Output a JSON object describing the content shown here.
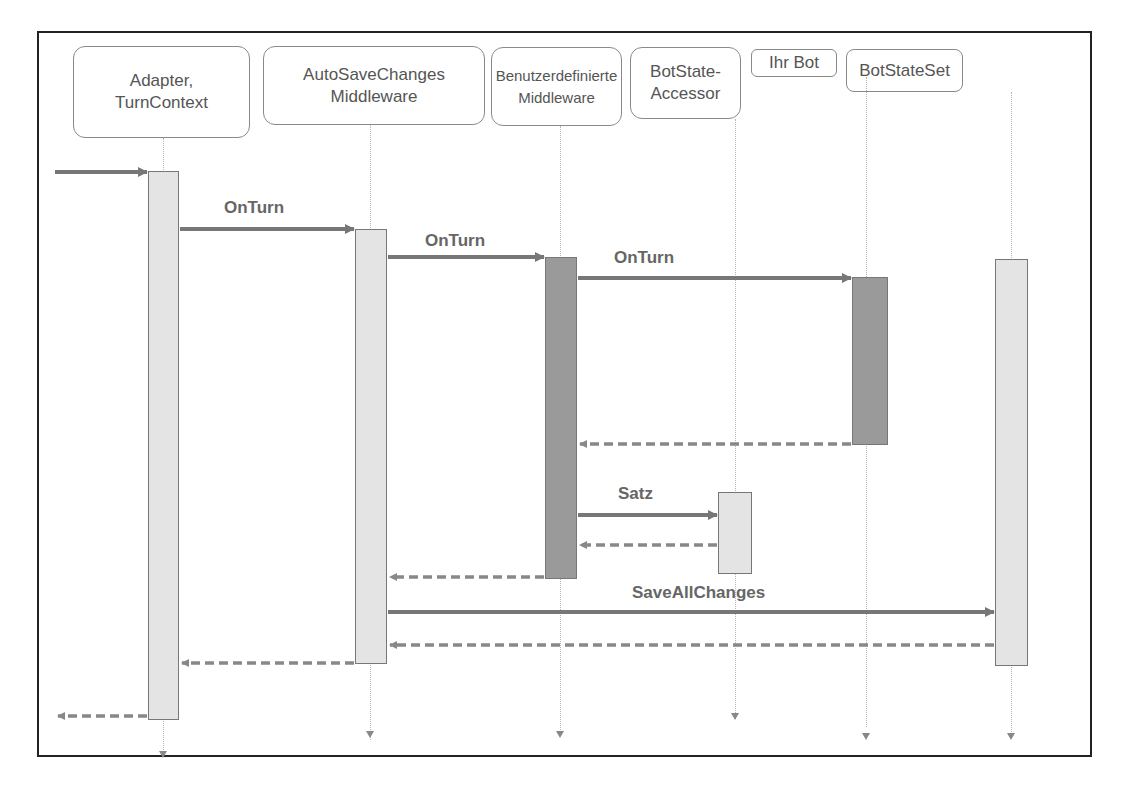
{
  "colors": {
    "frame": "#222222",
    "participant_border": "#8a8a8a",
    "text": "#555555",
    "arrow": "#777777",
    "activation_light": "#e4e4e4",
    "activation_dark": "#9a9a9a"
  },
  "participants": [
    {
      "id": "adapter",
      "label_line1": "Adapter,",
      "label_line2": "TurnContext"
    },
    {
      "id": "autosave",
      "label_line1": "AutoSaveChanges",
      "label_line2": "Middleware"
    },
    {
      "id": "custom",
      "label_line1": "Benutzerdefinierte",
      "label_line2": "Middleware"
    },
    {
      "id": "accessor",
      "label_line1": "BotState-",
      "label_line2": "Accessor"
    },
    {
      "id": "bot",
      "label_line1": "Ihr Bot",
      "label_line2": ""
    },
    {
      "id": "stateset",
      "label_line1": "BotStateSet",
      "label_line2": ""
    }
  ],
  "messages": [
    {
      "from": "external",
      "to": "adapter",
      "type": "call",
      "label": ""
    },
    {
      "from": "adapter",
      "to": "autosave",
      "type": "call",
      "label": "OnTurn"
    },
    {
      "from": "autosave",
      "to": "custom",
      "type": "call",
      "label": "OnTurn"
    },
    {
      "from": "custom",
      "to": "bot",
      "type": "call",
      "label": "OnTurn"
    },
    {
      "from": "bot",
      "to": "custom",
      "type": "return",
      "label": ""
    },
    {
      "from": "custom",
      "to": "accessor",
      "type": "call",
      "label": "Satz"
    },
    {
      "from": "accessor",
      "to": "custom",
      "type": "return",
      "label": ""
    },
    {
      "from": "custom",
      "to": "autosave",
      "type": "return",
      "label": ""
    },
    {
      "from": "autosave",
      "to": "stateset",
      "type": "call",
      "label": "SaveAllChanges"
    },
    {
      "from": "stateset",
      "to": "autosave",
      "type": "return",
      "label": ""
    },
    {
      "from": "autosave",
      "to": "adapter",
      "type": "return",
      "label": ""
    },
    {
      "from": "adapter",
      "to": "external",
      "type": "return",
      "label": ""
    }
  ]
}
